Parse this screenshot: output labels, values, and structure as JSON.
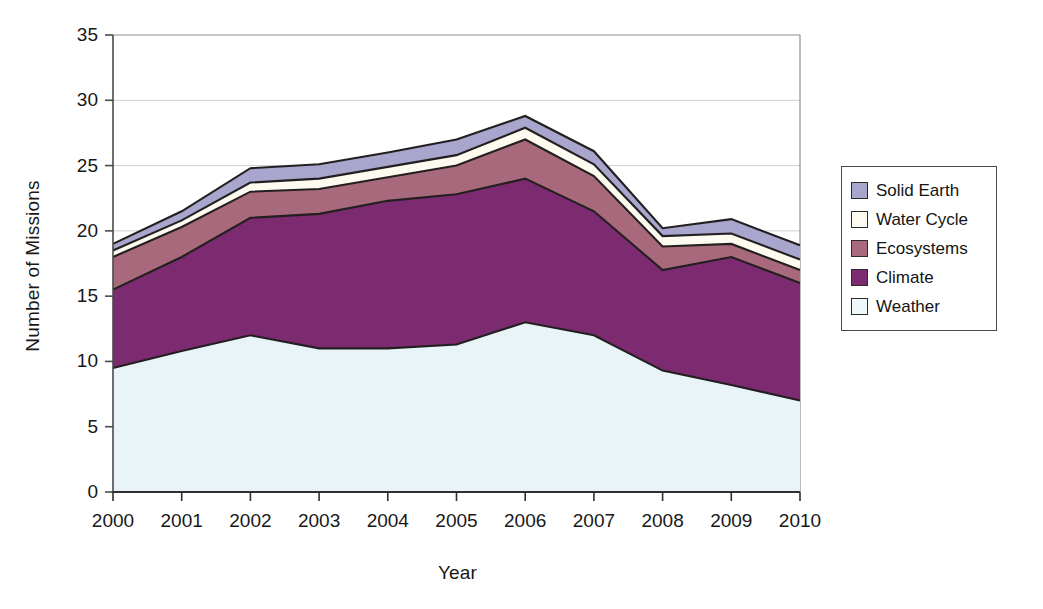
{
  "chart_data": {
    "type": "area",
    "stacked": true,
    "title": "",
    "xlabel": "Year",
    "ylabel": "Number of Missions",
    "categories": [
      "2000",
      "2001",
      "2002",
      "2003",
      "2004",
      "2005",
      "2006",
      "2007",
      "2008",
      "2009",
      "2010"
    ],
    "x": [
      2000,
      2001,
      2002,
      2003,
      2004,
      2005,
      2006,
      2007,
      2008,
      2009,
      2010
    ],
    "xlim": [
      2000,
      2010
    ],
    "ylim": [
      0,
      35
    ],
    "yticks": [
      "0",
      "5",
      "10",
      "15",
      "20",
      "25",
      "30",
      "35"
    ],
    "ytick_values": [
      0,
      5,
      10,
      15,
      20,
      25,
      30,
      35
    ],
    "grid": "horizontal",
    "legend_position": "right",
    "series": [
      {
        "name": "Weather",
        "color": "#e9f4f8",
        "values": [
          9.5,
          10.8,
          12.0,
          11.0,
          11.0,
          11.3,
          13.0,
          12.0,
          9.3,
          8.2,
          7.0
        ]
      },
      {
        "name": "Climate",
        "color": "#7c2b70",
        "values": [
          6.0,
          7.2,
          9.0,
          10.3,
          11.3,
          11.5,
          11.0,
          9.5,
          7.7,
          9.8,
          9.0
        ]
      },
      {
        "name": "Ecosystems",
        "color": "#a8697d",
        "values": [
          2.5,
          2.3,
          2.0,
          1.9,
          1.8,
          2.2,
          3.0,
          2.7,
          1.8,
          1.0,
          1.0
        ]
      },
      {
        "name": "Water Cycle",
        "color": "#fdfbf0",
        "values": [
          0.5,
          0.5,
          0.7,
          0.8,
          0.8,
          0.8,
          0.9,
          0.9,
          0.8,
          0.8,
          0.8
        ]
      },
      {
        "name": "Solid Earth",
        "color": "#a8a6cc",
        "values": [
          0.5,
          0.7,
          1.1,
          1.1,
          1.1,
          1.2,
          0.9,
          1.0,
          0.6,
          1.1,
          1.1
        ]
      }
    ],
    "cumulative_tops": {
      "weather": [
        9.5,
        10.8,
        12.0,
        11.0,
        11.0,
        11.3,
        13.0,
        12.0,
        9.3,
        8.2,
        7.0
      ],
      "climate": [
        15.5,
        18.0,
        21.0,
        21.3,
        22.3,
        22.8,
        24.0,
        21.5,
        17.0,
        18.0,
        16.0
      ],
      "ecosystems": [
        18.0,
        20.3,
        23.0,
        23.2,
        24.1,
        25.0,
        27.0,
        24.2,
        18.8,
        19.0,
        17.0
      ],
      "water_cycle": [
        18.5,
        20.8,
        23.7,
        24.0,
        24.9,
        25.8,
        27.9,
        25.1,
        19.6,
        19.8,
        17.8
      ],
      "solid_earth": [
        19.0,
        21.5,
        24.8,
        25.1,
        26.0,
        27.0,
        28.8,
        26.1,
        20.2,
        20.9,
        18.9
      ]
    }
  },
  "legend": {
    "items": [
      {
        "label": "Solid Earth",
        "color": "#a8a6cc"
      },
      {
        "label": "Water Cycle",
        "color": "#fdfbf0"
      },
      {
        "label": "Ecosystems",
        "color": "#a8697d"
      },
      {
        "label": "Climate",
        "color": "#7c2b70"
      },
      {
        "label": "Weather",
        "color": "#eef7fa"
      }
    ]
  },
  "axes": {
    "y_title": "Number of Missions",
    "x_title": "Year",
    "y_ticks": [
      "35",
      "30",
      "25",
      "20",
      "15",
      "10",
      "5",
      "0"
    ],
    "x_ticks": [
      "2000",
      "2001",
      "2002",
      "2003",
      "2004",
      "2005",
      "2006",
      "2007",
      "2008",
      "2009",
      "2010"
    ]
  },
  "colors": {
    "axis_line": "#4a4a4a",
    "grid_line": "#cfcfcf",
    "series_outline": "#231f20",
    "text": "#181818",
    "background": "#ffffff"
  }
}
